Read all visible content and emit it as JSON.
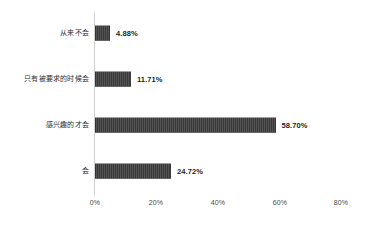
{
  "chart_data": {
    "type": "bar",
    "orientation": "horizontal",
    "title": "",
    "subtitle": "",
    "xlabel": "",
    "ylabel": "",
    "categories": [
      "从来不会",
      "只有被要求的时候会",
      "感兴趣的才会",
      "会"
    ],
    "values": [
      4.88,
      11.71,
      58.7,
      24.72
    ],
    "value_labels": [
      "4.88%",
      "11.71%",
      "58.70%",
      "24.72%"
    ],
    "series": [
      {
        "name": "",
        "values": [
          4.88,
          11.71,
          58.7,
          24.72
        ]
      }
    ],
    "xlim": [
      0,
      80
    ],
    "xticks": [
      0,
      20,
      40,
      60,
      80
    ],
    "xtick_labels": [
      "0%",
      "20%",
      "40%",
      "60%",
      "80%"
    ],
    "grid": false,
    "legend": false,
    "legend_position": "none",
    "bar_color": "#3a3a3a",
    "axis_color": "#d2d2d2",
    "label_color": "#2e2e2e",
    "background_color": "#ffffff"
  },
  "axis": {
    "tick_0": "0%",
    "tick_1": "20%",
    "tick_2": "40%",
    "tick_3": "60%",
    "tick_4": "80%"
  },
  "rows": [
    {
      "label": "从来不会",
      "value_label": "4.88%",
      "value": 4.88
    },
    {
      "label": "只有被要求的时候会",
      "value_label": "11.71%",
      "value": 11.71
    },
    {
      "label": "感兴趣的才会",
      "value_label": "58.70%",
      "value": 58.7
    },
    {
      "label": "会",
      "value_label": "24.72%",
      "value": 24.72
    }
  ]
}
